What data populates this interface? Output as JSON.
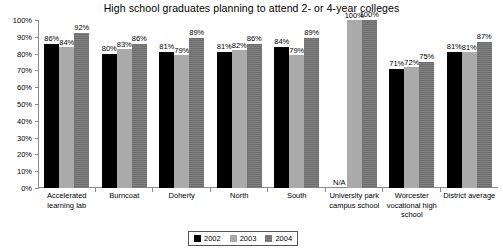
{
  "chart_data": {
    "type": "bar",
    "title": "High school graduates planning to attend 2- or 4-year colleges",
    "xlabel": "",
    "ylabel": "",
    "ylim": [
      0,
      100
    ],
    "ytick_labels": [
      "100%",
      "90%",
      "80%",
      "70%",
      "60%",
      "50%",
      "40%",
      "30%",
      "20%",
      "10%",
      "0%"
    ],
    "ytick_values": [
      100,
      90,
      80,
      70,
      60,
      50,
      40,
      30,
      20,
      10,
      0
    ],
    "grid": false,
    "legend_position": "bottom-center",
    "categories": [
      "Accelerated learning lab",
      "Burncoat",
      "Doherty",
      "North",
      "South",
      "University park campus school",
      "Worcester vocational high school",
      "District average"
    ],
    "series": [
      {
        "name": "2002",
        "color": "#000000",
        "values": [
          86,
          80,
          81,
          81,
          84,
          null,
          71,
          81
        ],
        "labels": [
          "86%",
          "80%",
          "81%",
          "81%",
          "84%",
          "N/A",
          "71%",
          "81%"
        ]
      },
      {
        "name": "2003",
        "color": "#aaaaaa",
        "values": [
          84,
          83,
          79,
          82,
          79,
          100,
          72,
          81
        ],
        "labels": [
          "84%",
          "83%",
          "79%",
          "82%",
          "79%",
          "100%",
          "72%",
          "81%"
        ]
      },
      {
        "name": "2004",
        "color": "#6e6e6e",
        "values": [
          92,
          86,
          89,
          86,
          89,
          100,
          75,
          87
        ],
        "labels": [
          "92%",
          "86%",
          "89%",
          "86%",
          "89%",
          "100%",
          "75%",
          "87%"
        ]
      }
    ],
    "missing_label": "N/A"
  }
}
